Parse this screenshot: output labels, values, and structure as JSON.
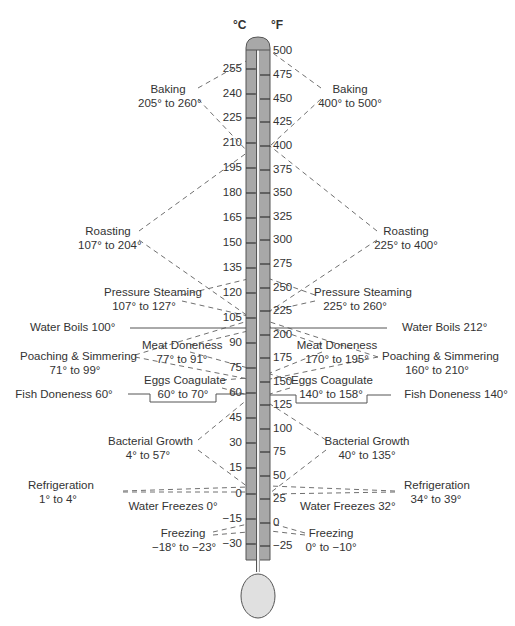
{
  "units": {
    "celsius": "°C",
    "fahrenheit": "°F"
  },
  "colors": {
    "tube": "#a8a8a8",
    "tube_border": "#555555",
    "bulb": "#e2e2e2",
    "line": "#666666",
    "text": "#333333"
  },
  "celsius_scale": [
    "255",
    "240",
    "225",
    "210",
    "195",
    "180",
    "165",
    "150",
    "135",
    "120",
    "105",
    "90",
    "75",
    "60",
    "45",
    "30",
    "15",
    "0",
    "−15",
    "−30"
  ],
  "fahrenheit_scale": [
    "500",
    "475",
    "450",
    "425",
    "400",
    "375",
    "350",
    "325",
    "300",
    "275",
    "250",
    "225",
    "200",
    "175",
    "150",
    "125",
    "100",
    "75",
    "50",
    "25",
    "0",
    "−25"
  ],
  "left_labels": {
    "baking": {
      "name": "Baking",
      "range": "205° to 260°"
    },
    "roasting": {
      "name": "Roasting",
      "range": "107° to 204°"
    },
    "pressure_steaming": {
      "name": "Pressure Steaming",
      "range": "107° to 127°"
    },
    "water_boils": "Water Boils 100°",
    "meat_doneness": {
      "name": "Meat Doneness",
      "range": "77° to 91°"
    },
    "poaching": {
      "name": "Poaching & Simmering",
      "range": "71° to 99°"
    },
    "eggs": {
      "name": "Eggs Coagulate",
      "range": "60° to 70°"
    },
    "fish": "Fish Doneness 60°",
    "bacterial": {
      "name": "Bacterial Growth",
      "range": "4° to 57°"
    },
    "refrigeration": {
      "name": "Refrigeration",
      "range": "1° to 4°"
    },
    "water_freezes": "Water Freezes 0°",
    "freezing": {
      "name": "Freezing",
      "range": "−18° to −23°"
    }
  },
  "right_labels": {
    "baking": {
      "name": "Baking",
      "range": "400° to 500°"
    },
    "roasting": {
      "name": "Roasting",
      "range": "225° to 400°"
    },
    "pressure_steaming": {
      "name": "Pressure Steaming",
      "range": "225° to 260°"
    },
    "water_boils": "Water Boils 212°",
    "meat_doneness": {
      "name": "Meat Doneness",
      "range": "170° to 195°"
    },
    "poaching": {
      "name": "Poaching & Simmering",
      "range": "160° to 210°"
    },
    "eggs": {
      "name": "Eggs Coagulate",
      "range": "140° to 158°"
    },
    "fish": "Fish Doneness 140°",
    "bacterial": {
      "name": "Bacterial Growth",
      "range": "40° to 135°"
    },
    "refrigeration": {
      "name": "Refrigeration",
      "range": "34° to 39°"
    },
    "water_freezes": "Water Freezes 32°",
    "freezing": {
      "name": "Freezing",
      "range": "0° to −10°"
    }
  }
}
